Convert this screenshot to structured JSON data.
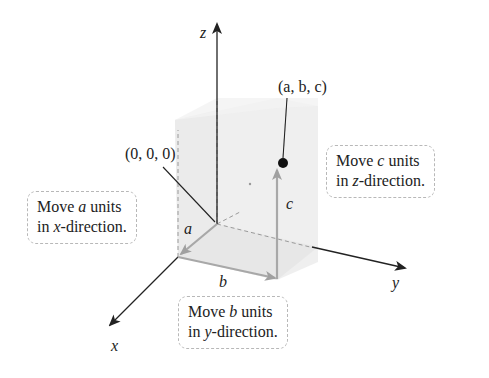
{
  "figure": {
    "type": "3d-coordinate-point-plot",
    "axes": {
      "x_label": "x",
      "y_label": "y",
      "z_label": "z"
    },
    "origin_label": "(0, 0, 0)",
    "point_label": "(a, b, c)",
    "segment_labels": {
      "a": "a",
      "b": "b",
      "c": "c"
    },
    "callouts": [
      {
        "id": "x-direction",
        "line1_pre": "Move ",
        "line1_var": "a",
        "line1_post": " units",
        "line2_pre": "in ",
        "line2_var": "x",
        "line2_post": "-direction."
      },
      {
        "id": "y-direction",
        "line1_pre": "Move ",
        "line1_var": "b",
        "line1_post": " units",
        "line2_pre": "in ",
        "line2_var": "y",
        "line2_post": "-direction."
      },
      {
        "id": "z-direction",
        "line1_pre": "Move ",
        "line1_var": "c",
        "line1_post": " units",
        "line2_pre": "in ",
        "line2_var": "z",
        "line2_post": "-direction."
      }
    ],
    "colors": {
      "axis": "#222222",
      "path_vectors": "#a8a8a8",
      "box_fill": "#e9e9e9",
      "box_side": "#dcdcdc",
      "point": "#111111",
      "callout_border": "#b8b8b8"
    }
  }
}
